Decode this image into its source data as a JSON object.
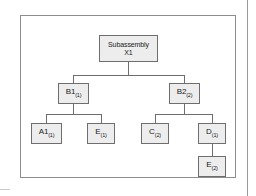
{
  "figure": {
    "type": "product-structure-tree",
    "colors": {
      "node_fill": "#ededed",
      "node_border": "#6e6e6e",
      "frame_border": "#8d8d8d",
      "connector": "#6e6e6e",
      "background": "#ffffff",
      "text": "#1a1a1a"
    },
    "nodes": {
      "root": {
        "name": "Subassembly",
        "code": "X1",
        "quantity": ""
      },
      "b1": {
        "name": "B1",
        "quantity": "(1)"
      },
      "b2": {
        "name": "B2",
        "quantity": "(2)"
      },
      "a1": {
        "name": "A1",
        "quantity": "(1)"
      },
      "e1": {
        "name": "E",
        "quantity": "(1)"
      },
      "c2": {
        "name": "C",
        "quantity": "(2)"
      },
      "d1": {
        "name": "D",
        "quantity": "(1)"
      },
      "e2": {
        "name": "E",
        "quantity": "(2)"
      }
    }
  }
}
